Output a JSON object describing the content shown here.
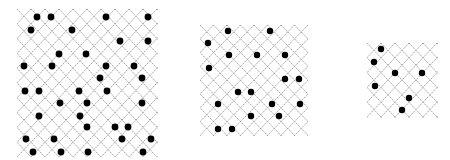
{
  "diagram": {
    "type": "lattice-dot-panels",
    "line_color": "#9a9a9a",
    "dot_color": "#000000",
    "background": "#ffffff",
    "panels": [
      {
        "id": "large",
        "x": 17,
        "y": 9,
        "width": 141,
        "height": 148,
        "pitch_x": 14,
        "pitch_y": 14.8,
        "cols": 10,
        "rows": 10,
        "dot_radius": 3.4,
        "dots": [
          [
            37,
            17
          ],
          [
            51,
            17
          ],
          [
            106,
            17
          ],
          [
            148,
            17
          ],
          [
            31,
            30
          ],
          [
            72,
            30
          ],
          [
            120,
            41
          ],
          [
            148,
            41
          ],
          [
            59,
            54
          ],
          [
            86,
            54
          ],
          [
            24,
            66
          ],
          [
            52,
            66
          ],
          [
            106,
            66
          ],
          [
            134,
            66
          ],
          [
            100,
            78
          ],
          [
            142,
            78
          ],
          [
            25,
            91
          ],
          [
            39,
            91
          ],
          [
            79,
            91
          ],
          [
            107,
            91
          ],
          [
            60,
            103
          ],
          [
            87,
            103
          ],
          [
            142,
            103
          ],
          [
            39,
            116
          ],
          [
            80,
            116
          ],
          [
            87,
            127
          ],
          [
            115,
            127
          ],
          [
            128,
            127
          ],
          [
            26,
            139
          ],
          [
            54,
            139
          ],
          [
            122,
            139
          ],
          [
            151,
            139
          ],
          [
            33,
            152
          ],
          [
            61,
            152
          ],
          [
            88,
            152
          ],
          [
            143,
            152
          ]
        ]
      },
      {
        "id": "medium",
        "x": 200,
        "y": 25,
        "width": 108,
        "height": 111,
        "pitch_x": 13.5,
        "pitch_y": 13.8,
        "cols": 8,
        "rows": 8,
        "dot_radius": 3.2,
        "dots": [
          [
            228,
            31
          ],
          [
            270,
            31
          ],
          [
            208,
            43
          ],
          [
            229,
            55
          ],
          [
            257,
            55
          ],
          [
            285,
            55
          ],
          [
            209,
            68
          ],
          [
            285,
            79
          ],
          [
            299,
            79
          ],
          [
            238,
            92
          ],
          [
            251,
            92
          ],
          [
            218,
            104
          ],
          [
            272,
            104
          ],
          [
            300,
            104
          ],
          [
            251,
            116
          ],
          [
            279,
            116
          ],
          [
            218,
            129
          ],
          [
            232,
            129
          ]
        ]
      },
      {
        "id": "small",
        "x": 367,
        "y": 43,
        "width": 71,
        "height": 75,
        "pitch_x": 14,
        "pitch_y": 14.8,
        "cols": 5,
        "rows": 5,
        "dot_radius": 3.2,
        "dots": [
          [
            381,
            49
          ],
          [
            374,
            62
          ],
          [
            395,
            73
          ],
          [
            422,
            73
          ],
          [
            375,
            86
          ],
          [
            409,
            98
          ],
          [
            402,
            110
          ]
        ]
      }
    ]
  }
}
